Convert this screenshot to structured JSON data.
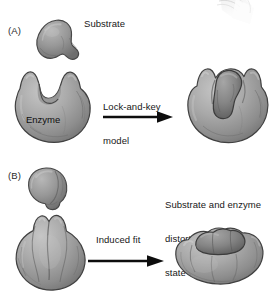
{
  "figure": {
    "type": "diagram",
    "style": "grayscale 3D molecular blob illustration, textbook figure",
    "background_color": "#ffffff",
    "ink_color": "#171717",
    "shape_fill": "#a3a3a3",
    "shape_shadow": "#6f6f6f",
    "shape_outline": "#3f3f3f",
    "substrate_fill": "#8e8e8e"
  },
  "panels": [
    {
      "id": "A",
      "letter": "(A)",
      "model_label": "Lock-and-key\nmodel",
      "model_label_lines": [
        "Lock-and-key",
        "model"
      ],
      "substrate_label": "Substrate",
      "enzyme_label": "Enzyme",
      "arrow": "right-arrow",
      "left_state": "Rigid substrate and rigid enzyme with preformed complementary cleft",
      "right_state": "Substrate bound in unchanged enzyme active site"
    },
    {
      "id": "B",
      "letter": "(B)",
      "model_label": "Induced fit",
      "model_label_lines": [
        "Induced fit"
      ],
      "result_label": "Substrate and enzyme\ndistorted to transition\nstate conformation",
      "result_label_lines": [
        "Substrate and enzyme",
        "distorted to transition",
        "state conformation"
      ],
      "arrow": "right-arrow",
      "left_state": "Rounded substrate and closed lobed enzyme",
      "right_state": "Flattened enzyme clamped around distorted substrate"
    }
  ],
  "artifacts": {
    "top_right": "faint scanned page-curl shadow"
  }
}
